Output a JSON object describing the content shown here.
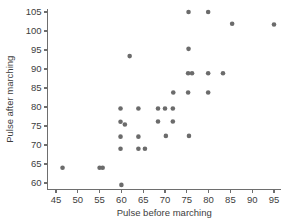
{
  "chart_data": {
    "type": "scatter",
    "title": "",
    "xlabel": "Pulse before marching",
    "ylabel": "Pulse after marching",
    "xlim": [
      43,
      96.5
    ],
    "ylim": [
      58,
      106.5
    ],
    "xticks": [
      45,
      50,
      55,
      60,
      65,
      70,
      75,
      80,
      85,
      90,
      95
    ],
    "yticks": [
      60,
      65,
      70,
      75,
      80,
      85,
      90,
      95,
      100,
      105
    ],
    "grid": false,
    "legend": null,
    "marker": "filled-circle",
    "marker_color": "#6b6b6b",
    "marker_size": 4.6,
    "points": [
      [
        46.5,
        64.0
      ],
      [
        55.0,
        64.0
      ],
      [
        55.7,
        64.0
      ],
      [
        60.0,
        59.5
      ],
      [
        59.8,
        69.0
      ],
      [
        59.8,
        72.2
      ],
      [
        59.8,
        76.1
      ],
      [
        60.8,
        75.4
      ],
      [
        59.8,
        79.6
      ],
      [
        61.9,
        93.4
      ],
      [
        63.9,
        69.0
      ],
      [
        65.4,
        69.0
      ],
      [
        63.9,
        72.2
      ],
      [
        63.9,
        79.6
      ],
      [
        68.4,
        76.2
      ],
      [
        68.4,
        79.6
      ],
      [
        70.0,
        79.6
      ],
      [
        70.2,
        72.4
      ],
      [
        71.8,
        79.6
      ],
      [
        71.8,
        76.2
      ],
      [
        71.9,
        83.8
      ],
      [
        75.3,
        83.8
      ],
      [
        75.5,
        72.4
      ],
      [
        75.3,
        88.9
      ],
      [
        76.2,
        88.9
      ],
      [
        75.4,
        95.3
      ],
      [
        75.4,
        105.0
      ],
      [
        79.9,
        83.8
      ],
      [
        79.9,
        88.9
      ],
      [
        79.9,
        105.0
      ],
      [
        83.3,
        88.9
      ],
      [
        85.4,
        101.9
      ],
      [
        95.0,
        101.7
      ]
    ]
  },
  "axes": {
    "x_axis_label": "Pulse before marching",
    "y_axis_label": "Pulse after marching",
    "x_tick_labels": [
      "45",
      "50",
      "55",
      "60",
      "65",
      "70",
      "75",
      "80",
      "85",
      "90",
      "95"
    ],
    "y_tick_labels": [
      "60",
      "65",
      "70",
      "75",
      "80",
      "85",
      "90",
      "95",
      "100",
      "105"
    ]
  }
}
